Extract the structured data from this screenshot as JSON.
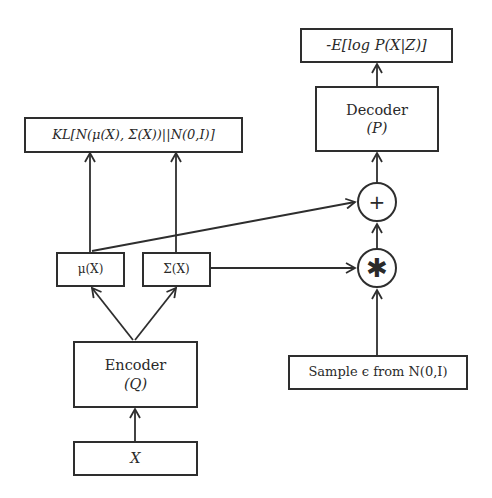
{
  "diagram": {
    "nodes": {
      "loss_recon": {
        "label": "-E[log P(X|Z)]"
      },
      "decoder": {
        "label": "Decoder",
        "sublabel": "(P)"
      },
      "kl_loss": {
        "label": "KL[N(μ(X), Σ(X))||N(0,I)]"
      },
      "plus_op": {
        "label": "+"
      },
      "mul_op": {
        "label": "✱"
      },
      "mu": {
        "label": "μ(X)"
      },
      "sigma": {
        "label": "Σ(X)"
      },
      "encoder": {
        "label": "Encoder",
        "sublabel": "(Q)"
      },
      "sample": {
        "label": "Sample ϵ from N(0,I)"
      },
      "input": {
        "label": "X"
      }
    },
    "edges": [
      {
        "from": "input",
        "to": "encoder"
      },
      {
        "from": "encoder",
        "to": "mu"
      },
      {
        "from": "encoder",
        "to": "sigma"
      },
      {
        "from": "mu",
        "to": "kl_loss"
      },
      {
        "from": "sigma",
        "to": "kl_loss"
      },
      {
        "from": "mu",
        "to": "plus_op"
      },
      {
        "from": "sigma",
        "to": "mul_op"
      },
      {
        "from": "sample",
        "to": "mul_op"
      },
      {
        "from": "mul_op",
        "to": "plus_op"
      },
      {
        "from": "plus_op",
        "to": "decoder"
      },
      {
        "from": "decoder",
        "to": "loss_recon"
      }
    ],
    "colors": {
      "stroke": "#2e2e2e",
      "background": "#ffffff"
    }
  }
}
